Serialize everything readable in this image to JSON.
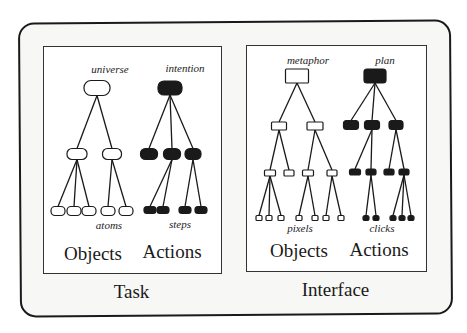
{
  "panels": [
    {
      "id": "task",
      "caption": "Task",
      "columns": [
        {
          "label": "Objects",
          "top_label": "universe",
          "bottom_label": "atoms",
          "node_style": "hollow-rounded",
          "levels": 3,
          "leaf_count": 5
        },
        {
          "label": "Actions",
          "top_label": "intention",
          "bottom_label": "steps",
          "node_style": "filled-rounded",
          "levels": 3,
          "leaf_count": 4
        }
      ]
    },
    {
      "id": "interface",
      "caption": "Interface",
      "columns": [
        {
          "label": "Objects",
          "top_label": "metaphor",
          "bottom_label": "pixels",
          "node_style": "hollow-rect",
          "levels": 4,
          "leaf_count": 7
        },
        {
          "label": "Actions",
          "top_label": "plan",
          "bottom_label": "clicks",
          "node_style": "filled-rect",
          "levels": 4,
          "leaf_count": 7
        }
      ]
    }
  ],
  "colors": {
    "ink": "#1a1a1a",
    "panel_bg": "#ffffff",
    "frame_bg": "#f7f7f5"
  },
  "trees": {
    "task_objects": {
      "nodes": [
        {
          "id": "r",
          "x": 97,
          "y": 88,
          "w": 26,
          "h": 15,
          "rx": 7
        },
        {
          "id": "a",
          "x": 77,
          "y": 154,
          "w": 20,
          "h": 11,
          "rx": 5
        },
        {
          "id": "b",
          "x": 112,
          "y": 154,
          "w": 19,
          "h": 11,
          "rx": 5
        },
        {
          "id": "a1",
          "x": 58,
          "y": 211,
          "w": 14,
          "h": 9,
          "rx": 4
        },
        {
          "id": "a2",
          "x": 74,
          "y": 211,
          "w": 14,
          "h": 9,
          "rx": 4
        },
        {
          "id": "a3",
          "x": 89,
          "y": 211,
          "w": 14,
          "h": 9,
          "rx": 4
        },
        {
          "id": "b1",
          "x": 108,
          "y": 211,
          "w": 14,
          "h": 9,
          "rx": 4
        },
        {
          "id": "b2",
          "x": 126,
          "y": 211,
          "w": 14,
          "h": 9,
          "rx": 4
        }
      ],
      "edges": [
        [
          "r",
          "a"
        ],
        [
          "r",
          "b"
        ],
        [
          "a",
          "a1"
        ],
        [
          "a",
          "a2"
        ],
        [
          "a",
          "a3"
        ],
        [
          "b",
          "b1"
        ],
        [
          "b",
          "b2"
        ]
      ],
      "fill": false
    },
    "task_actions": {
      "nodes": [
        {
          "id": "r",
          "x": 170,
          "y": 88,
          "w": 24,
          "h": 14,
          "rx": 6
        },
        {
          "id": "a",
          "x": 149,
          "y": 154,
          "w": 17,
          "h": 11,
          "rx": 5
        },
        {
          "id": "b",
          "x": 172,
          "y": 154,
          "w": 17,
          "h": 11,
          "rx": 5
        },
        {
          "id": "c",
          "x": 193,
          "y": 154,
          "w": 16,
          "h": 11,
          "rx": 5
        },
        {
          "id": "b1",
          "x": 150,
          "y": 210,
          "w": 12,
          "h": 7,
          "rx": 3
        },
        {
          "id": "b2",
          "x": 163,
          "y": 210,
          "w": 12,
          "h": 7,
          "rx": 3
        },
        {
          "id": "c1",
          "x": 185,
          "y": 210,
          "w": 12,
          "h": 7,
          "rx": 3
        },
        {
          "id": "c2",
          "x": 201,
          "y": 210,
          "w": 12,
          "h": 7,
          "rx": 3
        }
      ],
      "edges": [
        [
          "r",
          "a"
        ],
        [
          "r",
          "b"
        ],
        [
          "r",
          "c"
        ],
        [
          "b",
          "b1"
        ],
        [
          "b",
          "b2"
        ],
        [
          "c",
          "c1"
        ],
        [
          "c",
          "c2"
        ]
      ],
      "fill": true
    },
    "iface_objects": {
      "nodes": [
        {
          "id": "r",
          "x": 297,
          "y": 76,
          "w": 23,
          "h": 14,
          "rx": 1
        },
        {
          "id": "a",
          "x": 279,
          "y": 126,
          "w": 15,
          "h": 8,
          "rx": 1
        },
        {
          "id": "b",
          "x": 315,
          "y": 126,
          "w": 16,
          "h": 8,
          "rx": 1
        },
        {
          "id": "a1",
          "x": 270,
          "y": 173,
          "w": 11,
          "h": 6,
          "rx": 1
        },
        {
          "id": "a2",
          "x": 289,
          "y": 173,
          "w": 10,
          "h": 6,
          "rx": 1
        },
        {
          "id": "b1",
          "x": 308,
          "y": 173,
          "w": 11,
          "h": 6,
          "rx": 1
        },
        {
          "id": "b2",
          "x": 332,
          "y": 173,
          "w": 10,
          "h": 6,
          "rx": 1
        },
        {
          "id": "a11",
          "x": 259,
          "y": 218,
          "w": 6,
          "h": 5,
          "rx": 1
        },
        {
          "id": "a12",
          "x": 269,
          "y": 218,
          "w": 6,
          "h": 5,
          "rx": 1
        },
        {
          "id": "a13",
          "x": 281,
          "y": 218,
          "w": 6,
          "h": 5,
          "rx": 1
        },
        {
          "id": "b11",
          "x": 299,
          "y": 218,
          "w": 6,
          "h": 5,
          "rx": 1
        },
        {
          "id": "b12",
          "x": 315,
          "y": 218,
          "w": 6,
          "h": 5,
          "rx": 1
        },
        {
          "id": "b21",
          "x": 326,
          "y": 218,
          "w": 6,
          "h": 5,
          "rx": 1
        },
        {
          "id": "b22",
          "x": 341,
          "y": 218,
          "w": 6,
          "h": 5,
          "rx": 1
        }
      ],
      "edges": [
        [
          "r",
          "a"
        ],
        [
          "r",
          "b"
        ],
        [
          "a",
          "a1"
        ],
        [
          "a",
          "a2"
        ],
        [
          "b",
          "b1"
        ],
        [
          "b",
          "b2"
        ],
        [
          "a1",
          "a11"
        ],
        [
          "a1",
          "a12"
        ],
        [
          "a1",
          "a13"
        ],
        [
          "b1",
          "b11"
        ],
        [
          "b1",
          "b12"
        ],
        [
          "b2",
          "b21"
        ],
        [
          "b2",
          "b22"
        ]
      ],
      "fill": false
    },
    "iface_actions": {
      "nodes": [
        {
          "id": "r",
          "x": 375,
          "y": 76,
          "w": 22,
          "h": 14,
          "rx": 3
        },
        {
          "id": "a",
          "x": 351,
          "y": 125,
          "w": 15,
          "h": 9,
          "rx": 3
        },
        {
          "id": "b",
          "x": 372,
          "y": 125,
          "w": 15,
          "h": 9,
          "rx": 3
        },
        {
          "id": "c",
          "x": 396,
          "y": 125,
          "w": 14,
          "h": 9,
          "rx": 3
        },
        {
          "id": "b0",
          "x": 355,
          "y": 172,
          "w": 11,
          "h": 6,
          "rx": 2
        },
        {
          "id": "b1",
          "x": 371,
          "y": 172,
          "w": 10,
          "h": 6,
          "rx": 2
        },
        {
          "id": "c1",
          "x": 389,
          "y": 172,
          "w": 10,
          "h": 6,
          "rx": 2
        },
        {
          "id": "c2",
          "x": 404,
          "y": 172,
          "w": 10,
          "h": 6,
          "rx": 2
        },
        {
          "id": "b11",
          "x": 366,
          "y": 218,
          "w": 6,
          "h": 5,
          "rx": 2
        },
        {
          "id": "b12",
          "x": 376,
          "y": 218,
          "w": 6,
          "h": 5,
          "rx": 2
        },
        {
          "id": "c21",
          "x": 393,
          "y": 218,
          "w": 6,
          "h": 5,
          "rx": 2
        },
        {
          "id": "c22",
          "x": 402,
          "y": 218,
          "w": 6,
          "h": 5,
          "rx": 2
        },
        {
          "id": "c23",
          "x": 411,
          "y": 218,
          "w": 6,
          "h": 5,
          "rx": 2
        }
      ],
      "edges": [
        [
          "r",
          "a"
        ],
        [
          "r",
          "b"
        ],
        [
          "r",
          "c"
        ],
        [
          "b",
          "b0"
        ],
        [
          "b",
          "b1"
        ],
        [
          "c",
          "c1"
        ],
        [
          "c",
          "c2"
        ],
        [
          "b1",
          "b11"
        ],
        [
          "b1",
          "b12"
        ],
        [
          "c2",
          "c21"
        ],
        [
          "c2",
          "c22"
        ],
        [
          "c2",
          "c23"
        ]
      ],
      "fill": true
    }
  }
}
